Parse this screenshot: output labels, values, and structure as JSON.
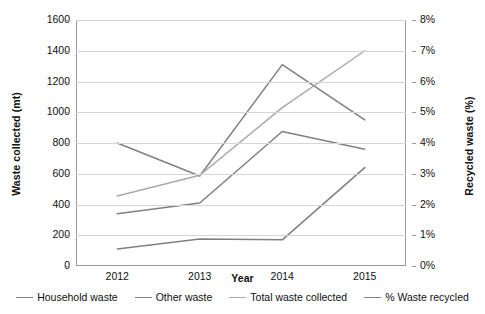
{
  "chart_data": {
    "type": "line",
    "title": "",
    "xlabel": "Year",
    "ylabel": "Waste collected (mt)",
    "y2label": "Recycled waste (%)",
    "categories": [
      "2012",
      "2013",
      "2014",
      "2015"
    ],
    "ylim": [
      0,
      1600
    ],
    "yticks": [
      "0",
      "200",
      "400",
      "600",
      "800",
      "1000",
      "1200",
      "1400",
      "1600"
    ],
    "y2lim": [
      0,
      8
    ],
    "y2ticks": [
      "0%",
      "1%",
      "2%",
      "3%",
      "4%",
      "5%",
      "6%",
      "7%",
      "8%"
    ],
    "grid": true,
    "legend_position": "bottom",
    "series": [
      {
        "name": "Household waste",
        "axis": "left",
        "unit": "mt",
        "color": "#808080",
        "values": [
          800,
          585,
          1310,
          950
        ]
      },
      {
        "name": "Other waste",
        "axis": "left",
        "unit": "mt",
        "color": "#808080",
        "values": [
          340,
          410,
          875,
          760
        ]
      },
      {
        "name": "Total waste collected",
        "axis": "left",
        "unit": "mt",
        "color": "#aaaaaa",
        "values": [
          455,
          590,
          1030,
          1400
        ]
      },
      {
        "name": "% Waste recycled",
        "axis": "right",
        "unit": "%",
        "color": "#808080",
        "values": [
          0.55,
          0.88,
          0.85,
          3.2
        ]
      }
    ]
  },
  "axes": {
    "x_title": "Year",
    "y_left_title": "Waste collected (mt)",
    "y_right_title": "Recycled waste (%)",
    "y_left_ticks": [
      "1600",
      "1400",
      "1200",
      "1000",
      "800",
      "600",
      "400",
      "200",
      "0"
    ],
    "y_right_ticks": [
      "8%",
      "7%",
      "6%",
      "5%",
      "4%",
      "3%",
      "2%",
      "1%",
      "0%"
    ],
    "x_ticks": [
      "2012",
      "2013",
      "2014",
      "2015"
    ]
  },
  "legend": {
    "items": [
      {
        "label": "Household waste",
        "color": "#808080"
      },
      {
        "label": "Other waste",
        "color": "#808080"
      },
      {
        "label": "Total waste collected",
        "color": "#aaaaaa"
      },
      {
        "label": "% Waste recycled",
        "color": "#808080"
      }
    ]
  }
}
